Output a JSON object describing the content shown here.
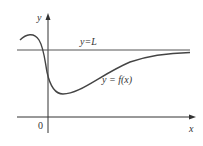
{
  "diagram": {
    "type": "function-graph-horizontal-asymptote",
    "axes": {
      "x_label": "x",
      "y_label": "y",
      "origin_label": "0"
    },
    "asymptote": {
      "label": "y=L"
    },
    "curve": {
      "label": "y = f(x)"
    },
    "colors": {
      "axes": "#333333",
      "curve": "#444444",
      "asymptote": "#555555",
      "background": "#ffffff"
    }
  }
}
